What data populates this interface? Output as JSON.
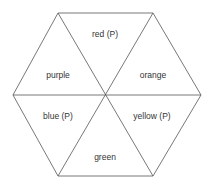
{
  "diagram": {
    "type": "hexagon-partition",
    "colors": {
      "stroke": "#555555",
      "text": "#333333",
      "background": "#ffffff"
    },
    "sectors": [
      {
        "id": "top",
        "label": "red (P)"
      },
      {
        "id": "upper-right",
        "label": "orange"
      },
      {
        "id": "lower-right",
        "label": "yellow (P)"
      },
      {
        "id": "bottom",
        "label": "green"
      },
      {
        "id": "lower-left",
        "label": "blue (P)"
      },
      {
        "id": "upper-left",
        "label": "purple"
      }
    ]
  }
}
